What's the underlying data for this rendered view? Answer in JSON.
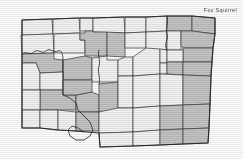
{
  "title": "Fox Squirrel",
  "map": {
    "region": "North Dakota",
    "legend_note": "shaded counties indicate species distribution",
    "colors": {
      "shaded": "#c3c3c1",
      "unshaded": "#f2f2f0",
      "county_border": "#3b3b3b",
      "state_border": "#2b2b2b",
      "river": "#2f2f2f",
      "background": "#fdfdfd",
      "title_text": "#4a4a4a"
    },
    "counties": [
      {
        "name": "divide",
        "shaded": false,
        "points": "22,20 52,19 53,34 22,35"
      },
      {
        "name": "burke",
        "shaded": false,
        "points": "53,19 79,18 80,33 53,34"
      },
      {
        "name": "renville",
        "shaded": false,
        "points": "80,18 93,18 93,31 80,31"
      },
      {
        "name": "bottineau",
        "shaded": false,
        "points": "93,18 124,17 125,33 93,32"
      },
      {
        "name": "rolette",
        "shaded": false,
        "points": "125,17 146,17 146,32 125,33"
      },
      {
        "name": "towner",
        "shaded": false,
        "points": "146,17 167,16 167,31 146,32"
      },
      {
        "name": "cavalier",
        "shaded": true,
        "points": "167,16 192,16 192,31 167,31"
      },
      {
        "name": "pembina",
        "shaded": true,
        "points": "192,16 215,18 215,34 192,31"
      },
      {
        "name": "williams",
        "shaded": false,
        "points": "21,35 53,34 54,53 22,54"
      },
      {
        "name": "mountrail",
        "shaded": false,
        "points": "54,34 80,33 80,40 85,40 85,53 54,53"
      },
      {
        "name": "ward",
        "shaded": true,
        "points": "85,31 93,31 93,32 107,32 107,56 85,56 85,40 80,40 80,33 85,33"
      },
      {
        "name": "mchenry",
        "shaded": true,
        "points": "107,32 125,33 125,57 107,56"
      },
      {
        "name": "pierce",
        "shaded": false,
        "points": "125,33 146,32 146,48 125,48"
      },
      {
        "name": "benson",
        "shaded": false,
        "points": "146,32 167,31 167,50 146,50"
      },
      {
        "name": "ramsey",
        "shaded": false,
        "points": "167,31 181,31 181,50 167,50"
      },
      {
        "name": "walsh",
        "shaded": true,
        "points": "181,31 192,31 215,34 213,48 183,48 181,45"
      },
      {
        "name": "grand-forks",
        "shaded": true,
        "points": "183,48 213,48 212,62 183,62"
      },
      {
        "name": "mckenzie",
        "shaded": true,
        "points": "22,54 54,53 54,59 63,60 63,72 40,73 36,63 22,63"
      },
      {
        "name": "dunn",
        "shaded": true,
        "points": "63,60 85,56 92,58 92,80 63,80 63,72"
      },
      {
        "name": "mclean",
        "shaded": false,
        "points": "92,58 107,56 107,60 118,60 118,82 92,82 92,80"
      },
      {
        "name": "sheridan",
        "shaded": false,
        "points": "118,60 125,57 133,57 133,76 118,76"
      },
      {
        "name": "wells",
        "shaded": false,
        "points": "133,57 146,48 160,49 160,74 133,76"
      },
      {
        "name": "eddy",
        "shaded": false,
        "points": "160,49 167,50 167,63 160,63"
      },
      {
        "name": "nelson",
        "shaded": false,
        "points": "167,50 183,50 183,62 167,62"
      },
      {
        "name": "foster",
        "shaded": false,
        "points": "160,63 167,63 167,74 160,74"
      },
      {
        "name": "griggs-steele",
        "shaded": true,
        "points": "167,62 183,62 183,75 167,74"
      },
      {
        "name": "traill",
        "shaded": true,
        "points": "183,62 212,62 211,76 183,75"
      },
      {
        "name": "golden-valley",
        "shaded": false,
        "points": "22,63 36,63 40,73 40,90 22,90"
      },
      {
        "name": "billings",
        "shaded": false,
        "points": "40,73 63,72 63,90 40,90"
      },
      {
        "name": "stark",
        "shaded": true,
        "points": "40,90 63,90 63,95 76,95 76,110 40,110"
      },
      {
        "name": "morton",
        "shaded": true,
        "points": "76,95 92,92 99,95 99,112 76,112 76,110"
      },
      {
        "name": "mercer-oliver",
        "shaded": true,
        "points": "63,80 92,80 92,92 76,95 63,95"
      },
      {
        "name": "burleigh",
        "shaded": true,
        "points": "99,84 118,82 118,112 99,112 99,95"
      },
      {
        "name": "kidder",
        "shaded": false,
        "points": "118,76 133,76 133,108 118,108"
      },
      {
        "name": "stutsman",
        "shaded": false,
        "points": "133,76 160,74 160,106 133,108"
      },
      {
        "name": "barnes",
        "shaded": false,
        "points": "160,74 183,75 183,105 160,106"
      },
      {
        "name": "cass",
        "shaded": true,
        "points": "183,75 211,76 210,104 183,105"
      },
      {
        "name": "slope-bowman",
        "shaded": false,
        "points": "22,90 40,90 40,110 22,110"
      },
      {
        "name": "hettinger",
        "shaded": false,
        "points": "22,110 40,110 40,128 22,128"
      },
      {
        "name": "adams",
        "shaded": false,
        "points": "40,110 58,110 58,130 40,128"
      },
      {
        "name": "grant",
        "shaded": false,
        "points": "58,110 76,112 76,131 58,130"
      },
      {
        "name": "sioux",
        "shaded": true,
        "points": "76,112 99,112 99,131 76,131"
      },
      {
        "name": "emmons",
        "shaded": false,
        "points": "99,112 118,108 133,108 133,132 99,133"
      },
      {
        "name": "logan-lamoure",
        "shaded": false,
        "points": "133,108 160,106 160,130 133,132"
      },
      {
        "name": "ransom",
        "shaded": true,
        "points": "160,106 183,105 183,129 160,130"
      },
      {
        "name": "richland",
        "shaded": true,
        "points": "183,105 210,104 209,128 183,129"
      },
      {
        "name": "mcintosh",
        "shaded": false,
        "points": "99,133 133,132 133,146 100,147"
      },
      {
        "name": "dickey",
        "shaded": false,
        "points": "133,132 160,130 160,145 133,146"
      },
      {
        "name": "sargent",
        "shaded": true,
        "points": "160,130 183,129 183,144 160,145"
      },
      {
        "name": "se-corner",
        "shaded": true,
        "points": "183,129 209,128 208,143 183,144"
      }
    ],
    "state_outline": "22,20 52,19 79,18 93,18 124,17 146,17 167,16 192,16 215,18 215,34 213,48 212,62 211,76 210,104 209,128 208,143 183,144 160,145 133,146 100,147 99,133 76,131 58,130 40,128 22,128 22,110 22,90 22,63 22,54 22,35",
    "river_path": "M22,54 C26,50 30,56 34,52 C38,48 42,55 46,51 C50,47 54,54 58,51 C62,49 63,56 63,60 L63,72 L63,80 L63,90 L63,95 L70,98 L76,103 L78,110 L84,116 L90,122 L93,130 L90,136 L84,140 L76,140 L70,136 L68,130 L72,126 L78,128 L84,132 M99,84 C101,78 97,72 99,66 C101,60 97,56 99,50 M167,16 C169,22 165,28 167,34 C169,40 163,44 167,50"
  }
}
